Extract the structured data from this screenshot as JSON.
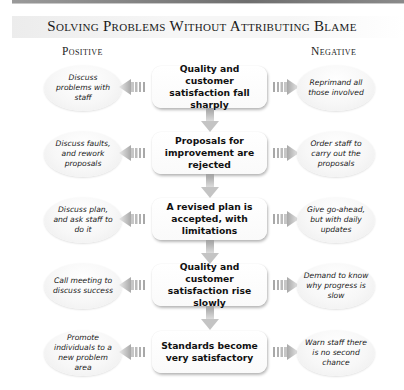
{
  "title": "Solving Problems Without Attributing Blame",
  "columns": {
    "positive": "Positive",
    "negative": "Negative"
  },
  "colors": {
    "arrow_gray": "#b8b8b8",
    "box_bg": "#ffffff",
    "shadow": "#9a9a9a"
  },
  "steps": [
    {
      "center": "Quality and customer satisfaction fall sharply",
      "positive": "Discuss problems with staff",
      "negative": "Reprimand all those involved"
    },
    {
      "center": "Proposals for improvement are rejected",
      "positive": "Discuss faults, and rework proposals",
      "negative": "Order staff to carry out the proposals"
    },
    {
      "center": "A revised plan is accepted, with limitations",
      "positive": "Discuss plan, and ask staff to do it",
      "negative": "Give go-ahead, but with daily updates"
    },
    {
      "center": "Quality and customer satisfaction rise slowly",
      "positive": "Call meeting to discuss success",
      "negative": "Demand to know why progress is slow"
    },
    {
      "center": "Standards become very satisfactory",
      "positive": "Promote individuals to a new problem area",
      "negative": "Warn staff there is no second chance"
    }
  ]
}
